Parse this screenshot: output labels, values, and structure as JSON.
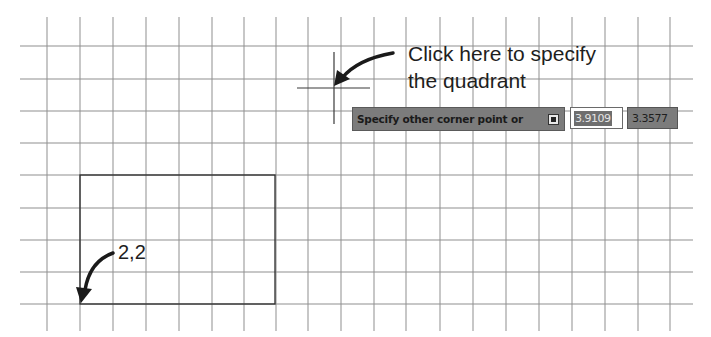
{
  "drawing": {
    "grid": {
      "vertical_lines_x": [
        47,
        80,
        113,
        146,
        179,
        212,
        244,
        276,
        308,
        341,
        374,
        406,
        440,
        473,
        506,
        539,
        572,
        605,
        638,
        670
      ],
      "horizontal_lines_y": [
        46,
        79,
        111,
        143,
        175,
        208,
        240,
        272,
        304
      ],
      "line_color": "#8a8a8a"
    },
    "rectangle": {
      "x1": 80,
      "y1": 175,
      "x2": 275,
      "y2": 304,
      "color": "#2a2a2a"
    },
    "crosshair": {
      "x": 334,
      "y": 88
    }
  },
  "annotations": {
    "instruction_line1": "Click here to specify",
    "instruction_line2": "the quadrant",
    "start_point_label": "2,2"
  },
  "command_prompt": {
    "text": "Specify other corner point or",
    "options_icon": "down-arrow-options-icon"
  },
  "dynamic_input": {
    "x_value": "3.9109",
    "y_value": "3.3577"
  },
  "colors": {
    "prompt_bg": "#7c7c7c",
    "text_dark": "#1e1e1e",
    "selection_bg": "#6e6e6e"
  }
}
